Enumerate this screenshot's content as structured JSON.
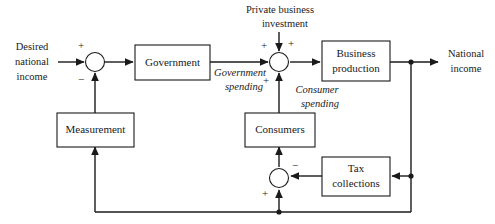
{
  "diagram": {
    "colors": {
      "line": "#1a1a1a",
      "text": "#1a1a1a",
      "background": "#ffffff"
    },
    "blocks": [
      {
        "id": "government",
        "label": "Government",
        "lines": [
          "Government"
        ]
      },
      {
        "id": "measurement",
        "label": "Measurement",
        "lines": [
          "Measurement"
        ]
      },
      {
        "id": "business-production",
        "label": "Business production",
        "lines": [
          "Business",
          "production"
        ]
      },
      {
        "id": "consumers",
        "label": "Consumers",
        "lines": [
          "Consumers"
        ]
      },
      {
        "id": "tax-collections",
        "label": "Tax collections",
        "lines": [
          "Tax",
          "collections"
        ]
      }
    ],
    "signals": {
      "desired_national_income": {
        "lines": [
          "Desired",
          "national",
          "income"
        ]
      },
      "national_income": {
        "lines": [
          "National",
          "income"
        ]
      },
      "private_business_investment": {
        "lines": [
          "Private business",
          "investment"
        ]
      },
      "government_spending": {
        "lines": [
          "Government",
          "spending"
        ]
      },
      "consumer_spending": {
        "lines": [
          "Consumer",
          "spending"
        ]
      }
    },
    "summing_junctions": [
      {
        "id": "error-junction",
        "name": "error-summing-junction",
        "signs": [
          {
            "id": "error-plus",
            "symbol": "+",
            "input": "desired-national-income"
          },
          {
            "id": "error-minus",
            "symbol": "−",
            "input": "measurement-feedback"
          }
        ]
      },
      {
        "id": "demand-junction",
        "name": "aggregate-demand-summing-junction",
        "signs": [
          {
            "id": "demand-plus-left",
            "symbol": "+",
            "input": "government-spending"
          },
          {
            "id": "demand-plus-top",
            "symbol": "+",
            "input": "private-business-investment"
          },
          {
            "id": "demand-plus-bottom",
            "symbol": "+",
            "input": "consumer-spending"
          }
        ]
      },
      {
        "id": "disposable-income-junction",
        "name": "disposable-income-summing-junction",
        "signs": [
          {
            "id": "tax-minus",
            "symbol": "−",
            "input": "tax-collections"
          },
          {
            "id": "income-plus",
            "symbol": "+",
            "input": "national-income-feedback"
          }
        ]
      }
    ]
  }
}
